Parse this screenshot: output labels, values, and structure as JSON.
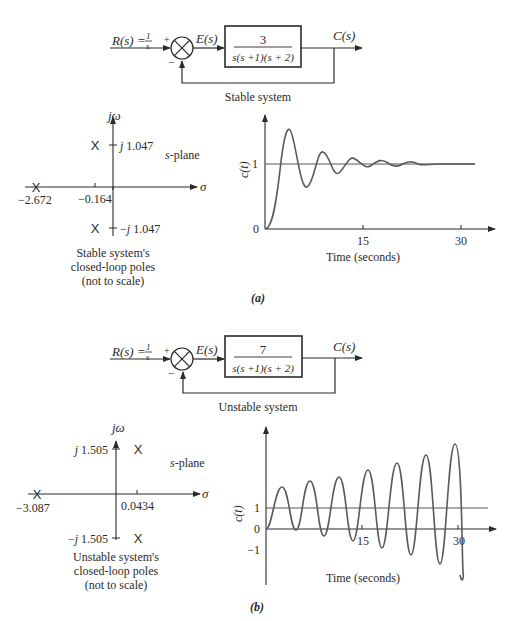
{
  "panel_a": {
    "label": "(a)",
    "block": {
      "input": "R(s) = ",
      "input_frac_num": "1",
      "input_frac_den": "s",
      "plus": "+",
      "minus": "−",
      "error": "E(s)",
      "gain": "3",
      "denominator": "s(s +1)(s + 2)",
      "output": "C(s)",
      "caption": "Stable system"
    },
    "s_plane": {
      "axis_vertical": "jω",
      "axis_horizontal": "σ",
      "plane_label": "s-plane",
      "pole_upper": "j 1.047",
      "pole_lower": "−j 1.047",
      "real_pole": "−2.672",
      "real_part": "−0.164",
      "caption_lines": [
        "Stable system's",
        "closed-loop poles",
        "(not to scale)"
      ]
    },
    "response": {
      "ylabel": "c(t)",
      "ytick_1": "1",
      "ytick_0": "0",
      "xtick_15": "15",
      "xtick_30": "30",
      "xlabel": "Time (seconds)"
    }
  },
  "panel_b": {
    "label": "(b)",
    "block": {
      "input": "R(s) = ",
      "input_frac_num": "1",
      "input_frac_den": "s",
      "plus": "+",
      "minus": "−",
      "error": "E(s)",
      "gain": "7",
      "denominator": "s(s +1)(s + 2)",
      "output": "C(s)",
      "caption": "Unstable system"
    },
    "s_plane": {
      "axis_vertical": "jω",
      "axis_horizontal": "σ",
      "plane_label": "s-plane",
      "pole_upper": "j 1.505",
      "pole_lower": "−j 1.505",
      "real_pole": "−3.087",
      "real_part": "0.0434",
      "caption_lines": [
        "Unstable system's",
        "closed-loop poles",
        "(not to scale)"
      ]
    },
    "response": {
      "ylabel": "c(t)",
      "ytick_1": "1",
      "ytick_0": "0",
      "ytick_m1": "−1",
      "xtick_15": "15",
      "xtick_30": "30",
      "xlabel": "Time (seconds)"
    }
  },
  "colors": {
    "ink": "#2b2b2b",
    "background": "#ffffff",
    "curve": "#555555"
  }
}
